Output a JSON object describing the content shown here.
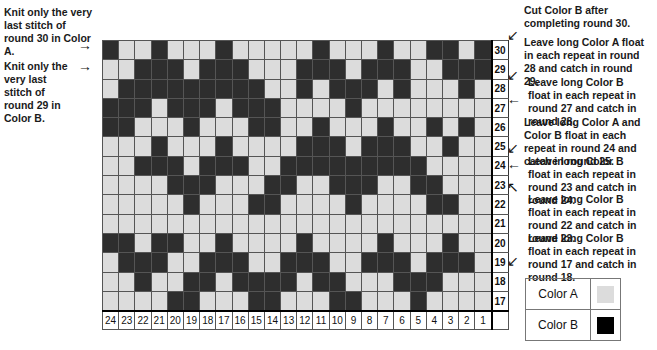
{
  "left_notes": [
    {
      "text": "Knit only the very last stitch of round 30 in Color A.",
      "arrow": "→"
    },
    {
      "text": "Knit only the very last stitch of round 29 in Color B.",
      "arrow": "→"
    }
  ],
  "right_notes": [
    {
      "text": "Cut Color B after completing round 30.",
      "arrow": "↙"
    },
    {
      "text": "Leave long Color A float in each repeat in round 28 and catch in round 29.",
      "arrow": "↙"
    },
    {
      "text": "Leave long Color B float in each repeat in round 27 and catch in round 28.",
      "arrow": "←"
    },
    {
      "text": "Leave long Color A and Color B float in each repeat in round 24 and catch in round 25.",
      "arrow": "↙"
    },
    {
      "text": "Leave long Color B float in each repeat in round 23 and catch in round 24.",
      "arrow": "←"
    },
    {
      "text": "Leave long Color B float in each repeat in round 22 and catch in round 23.",
      "arrow": "↖"
    },
    {
      "text": "Leave long Color B float in each repeat in round 17 and catch in round 18.",
      "arrow": "↙"
    }
  ],
  "chart": {
    "columns": [
      "24",
      "23",
      "22",
      "21",
      "20",
      "19",
      "18",
      "17",
      "16",
      "15",
      "14",
      "13",
      "12",
      "11",
      "10",
      "9",
      "8",
      "7",
      "6",
      "5",
      "4",
      "3",
      "2",
      "1"
    ],
    "rows": [
      {
        "round": "30",
        "cells": "DLLDLLLDLLLLLDLLLDLLDDLD"
      },
      {
        "round": "29",
        "cells": "LLDDDLDDDLLLDDDLDDDLLDDD"
      },
      {
        "round": "28",
        "cells": "LDDDDDDDDDLLDLDDDLDLLLDL"
      },
      {
        "round": "27",
        "cells": "DDDLDDDLDDDLLLLDLLLLLLLL"
      },
      {
        "round": "26",
        "cells": "DDLLLDLLLDDLLDLLLDLLDLDL"
      },
      {
        "round": "25",
        "cells": "LLLDLLLDLLLLDDDLDDDLLDLL"
      },
      {
        "round": "24",
        "cells": "LLDDDLDDDLLDDDDDDDDDLLLL"
      },
      {
        "round": "23",
        "cells": "LLLLDDDLLLDDLLDDDLLDDLLL"
      },
      {
        "round": "22",
        "cells": "LLLLLDLLLDDLLLLDLLLLDDLL"
      },
      {
        "round": "21",
        "cells": "LLLLLLLLLLLLLLLLLLLLLLLL"
      },
      {
        "round": "20",
        "cells": "DDLDDLLDLLLLDLLLLDLLLDLL"
      },
      {
        "round": "19",
        "cells": "LDDDLLDDDLLDDDLLDDDLDDDL"
      },
      {
        "round": "18",
        "cells": "LLDLLDDLDDDDLDDLLLDDDLLL"
      },
      {
        "round": "17",
        "cells": "LLLLDDLLLDDLLLDDLLLDLLLL"
      }
    ],
    "legend_key": {
      "L": "Color A",
      "D": "Color B"
    }
  },
  "legend": [
    {
      "label": "Color A",
      "color": "#dcdcdc"
    },
    {
      "label": "Color B",
      "color": "#000000"
    }
  ]
}
